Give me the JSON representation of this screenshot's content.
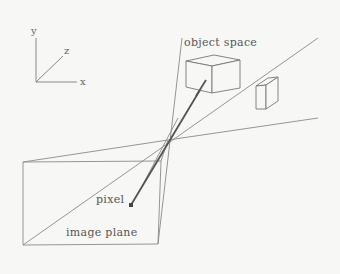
{
  "diagram": {
    "labels": {
      "object_space": "object space",
      "image_plane": "image plane",
      "pixel": "pixel"
    },
    "axes": {
      "x": "x",
      "y": "y",
      "z": "z"
    },
    "colors": {
      "background": "#f7f7f5",
      "line": "#8a8a8a",
      "ray": "#555555",
      "text": "#555555"
    }
  }
}
